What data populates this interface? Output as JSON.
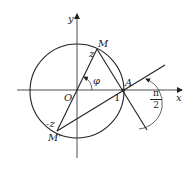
{
  "diagram": {
    "type": "geometry",
    "axes": {
      "x_label": "x",
      "y_label": "y",
      "origin_label": "O"
    },
    "points": {
      "M": {
        "label": "M",
        "vertex_label": "z"
      },
      "M_prime": {
        "label": "M'",
        "vertex_label": "-z"
      },
      "A": {
        "label": "A",
        "coord_label": "1"
      }
    },
    "angles": {
      "phi": {
        "label": "φ"
      },
      "right": {
        "numerator": "π",
        "denominator": "2"
      }
    },
    "colors": {
      "stroke": "#222222",
      "background": "#ffffff"
    }
  }
}
